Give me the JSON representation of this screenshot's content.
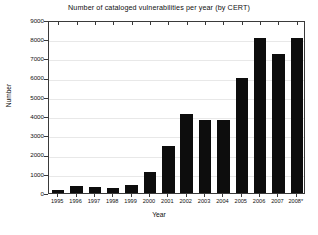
{
  "chart_data": {
    "type": "bar",
    "title": "Number of cataloged vulnerabilities per year (by CERT)",
    "xlabel": "Year",
    "ylabel": "Number",
    "categories": [
      "1995",
      "1996",
      "1997",
      "1998",
      "1999",
      "2000",
      "2001",
      "2002",
      "2003",
      "2004",
      "2005",
      "2006",
      "2007",
      "2008*"
    ],
    "values": [
      171,
      345,
      311,
      262,
      417,
      1090,
      2437,
      4129,
      3784,
      3780,
      5990,
      8064,
      7236,
      8064
    ],
    "ylim": [
      0,
      9000
    ],
    "ytick_labels": [
      "0",
      "1000",
      "2000",
      "3000",
      "4000",
      "5000",
      "6000",
      "7000",
      "8000",
      "9000"
    ],
    "ytick_values": [
      0,
      1000,
      2000,
      3000,
      4000,
      5000,
      6000,
      7000,
      8000,
      9000
    ],
    "grid": true,
    "legend": false,
    "bar_color": "#0d0d0d",
    "grid_color": "#e8e8e8",
    "axis_color": "#3a3a3a",
    "footnote_marker": "*"
  }
}
